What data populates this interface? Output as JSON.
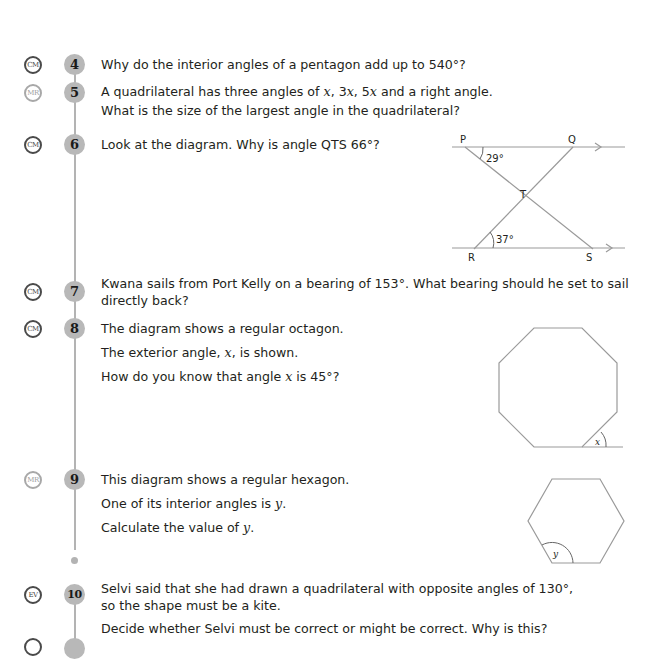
{
  "page": {
    "type": "textbook exercise page",
    "colors": {
      "text": "#231f20",
      "number_circle": "#b8b8b8",
      "timeline": "#b3b3b3",
      "badge_dark": "#4a4a4a",
      "badge_light": "#a8a8a8"
    }
  },
  "questions": [
    {
      "number": "4",
      "badge": "CM",
      "lines": [
        "Why do the interior angles of a pentagon add up to 540°?"
      ]
    },
    {
      "number": "5",
      "badge": "MR",
      "line1_pre": "A quadrilateral has three angles of ",
      "line1_x": "x",
      "line1_sep1": ", 3",
      "line1_x2": "x",
      "line1_sep2": ", 5",
      "line1_x3": "x",
      "line1_post": " and a right angle.",
      "line2": "What is the size of the largest angle in the quadrilateral?"
    },
    {
      "number": "6",
      "badge": "CM",
      "lines": [
        "Look at the diagram. Why is angle QTS 66°?"
      ],
      "diagram": {
        "type": "parallel-lines-crossing",
        "labels": {
          "p": "P",
          "q": "Q",
          "t": "T",
          "r": "R",
          "s": "S"
        },
        "angle_top": "29°",
        "angle_bottom": "37°"
      }
    },
    {
      "number": "7",
      "badge": "CM",
      "lines": [
        "Kwana sails from Port Kelly on a bearing of 153°. What bearing should he set to sail",
        "directly back?"
      ]
    },
    {
      "number": "8",
      "badge": "CM",
      "line1": "The diagram shows a regular octagon.",
      "line2_pre": "The exterior angle, ",
      "line2_x": "x",
      "line2_post": ", is shown.",
      "line3_pre": "How do you know that angle ",
      "line3_x": "x",
      "line3_post": " is 45°?",
      "diagram": {
        "type": "regular-octagon",
        "angle_label": "x"
      }
    },
    {
      "number": "9",
      "badge": "MR",
      "line1": "This diagram shows a regular hexagon.",
      "line2_pre": "One of its interior angles is ",
      "line2_y": "y",
      "line2_post": ".",
      "line3_pre": "Calculate the value of ",
      "line3_y": "y",
      "line3_post": ".",
      "diagram": {
        "type": "regular-hexagon",
        "angle_label": "y"
      }
    },
    {
      "number": "10",
      "badge": "EV",
      "lines": [
        "Selvi said that she had drawn a quadrilateral with opposite angles of 130°,",
        "so the shape must be a kite.",
        "Decide whether Selvi must be correct or might be correct. Why is this?"
      ]
    }
  ]
}
